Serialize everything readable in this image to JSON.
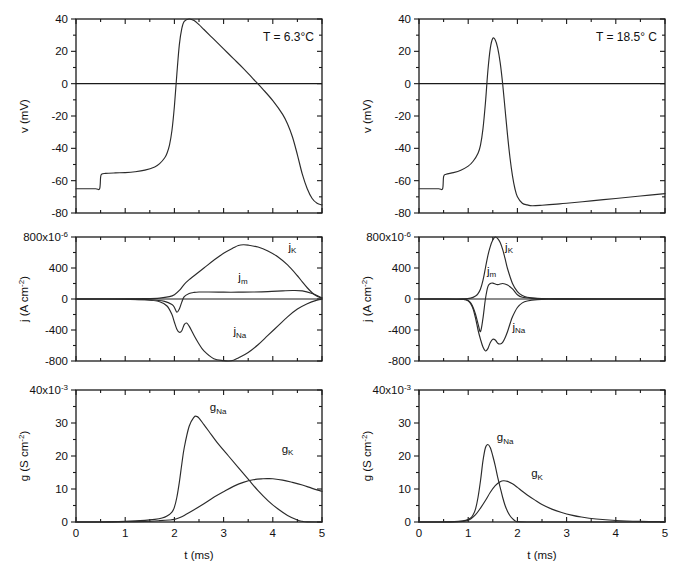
{
  "figure": {
    "title": "",
    "columns": [
      {
        "id": "left",
        "annotation": "T = 6.3°C"
      },
      {
        "id": "right",
        "annotation": "T = 18.5° C"
      }
    ],
    "xlabel": "t (ms)",
    "xlabel_2": "t (ms)"
  },
  "axes": {
    "x": {
      "label": "t (ms)",
      "min": 0,
      "max": 5,
      "ticks": [
        0,
        1,
        2,
        3,
        4,
        5
      ],
      "ticklabels": [
        "0",
        "1",
        "2",
        "3",
        "4",
        "5"
      ],
      "minor_ticks": [
        0.5,
        1.5,
        2.5,
        3.5,
        4.5
      ]
    },
    "v": {
      "label": "v (mV)",
      "min": -80,
      "max": 40,
      "ticks": [
        -80,
        -60,
        -40,
        -20,
        0,
        20,
        40
      ],
      "ticklabels": [
        "-80",
        "-60",
        "-40",
        "-20",
        "0",
        "20",
        "40"
      ],
      "minor_ticks": [
        -70,
        -50,
        -30,
        -10,
        10,
        30
      ]
    },
    "j": {
      "label": "j (A cm",
      "label_sup": "-2",
      "label_tail": ")",
      "min": -800,
      "max": 800,
      "ticks": [
        -800,
        -400,
        0,
        400,
        800
      ],
      "ticklabels": [
        "-800",
        "-400",
        "0",
        "400",
        "800x10"
      ],
      "exponent": "-6",
      "minor_ticks": [
        -600,
        -200,
        200,
        600
      ]
    },
    "g": {
      "label": "g (S cm",
      "label_sup": "-2",
      "label_tail": ")",
      "min": 0,
      "max": 40,
      "ticks": [
        0,
        10,
        20,
        30,
        40
      ],
      "ticklabels": [
        "0",
        "10",
        "20",
        "30",
        "40x10"
      ],
      "exponent": "-3",
      "minor_ticks": [
        5,
        15,
        25,
        35
      ]
    }
  },
  "chart_data": [
    {
      "id": "v-left",
      "type": "line",
      "title": "",
      "annotation": "T = 6.3°C",
      "xlabel": "",
      "ylabel": "v (mV)",
      "xlim": [
        0,
        5
      ],
      "ylim": [
        -80,
        40
      ],
      "grid": false,
      "legend": "none",
      "zero_line": 0,
      "series": [
        {
          "name": "v",
          "x": [
            0,
            0.2,
            0.4,
            0.48,
            0.5,
            0.52,
            0.6,
            0.8,
            1.0,
            1.2,
            1.4,
            1.6,
            1.7,
            1.8,
            1.85,
            1.9,
            1.95,
            2.0,
            2.05,
            2.1,
            2.15,
            2.2,
            2.3,
            2.4,
            2.5,
            2.6,
            2.8,
            3.0,
            3.2,
            3.4,
            3.6,
            3.8,
            4.0,
            4.2,
            4.3,
            4.4,
            4.5,
            4.6,
            4.7,
            4.8,
            4.9,
            5.0
          ],
          "y": [
            -65,
            -65,
            -65,
            -65,
            -58,
            -56,
            -55.5,
            -55.2,
            -55,
            -54.5,
            -53.5,
            -51.5,
            -49.5,
            -46,
            -43,
            -38,
            -29,
            -14,
            6,
            24,
            34,
            38.5,
            40,
            39,
            36.5,
            33.5,
            27.5,
            21.5,
            15.5,
            9.5,
            3,
            -3.5,
            -10.5,
            -19,
            -25,
            -33,
            -44,
            -56,
            -65,
            -71,
            -74,
            -75
          ]
        }
      ]
    },
    {
      "id": "v-right",
      "type": "line",
      "title": "",
      "annotation": "T = 18.5° C",
      "xlabel": "",
      "ylabel": "v (mV)",
      "xlim": [
        0,
        5
      ],
      "ylim": [
        -80,
        40
      ],
      "grid": false,
      "legend": "none",
      "zero_line": 0,
      "series": [
        {
          "name": "v",
          "x": [
            0,
            0.2,
            0.4,
            0.48,
            0.5,
            0.55,
            0.7,
            0.85,
            1.0,
            1.1,
            1.2,
            1.25,
            1.3,
            1.35,
            1.4,
            1.45,
            1.5,
            1.55,
            1.6,
            1.65,
            1.7,
            1.75,
            1.8,
            1.85,
            1.9,
            1.95,
            2.0,
            2.1,
            2.2,
            2.3,
            2.5,
            2.8,
            3.0,
            3.5,
            4.0,
            4.5,
            5.0
          ],
          "y": [
            -65,
            -65,
            -65,
            -65,
            -57.5,
            -56,
            -55,
            -53.5,
            -51,
            -48,
            -43,
            -38,
            -28,
            -12,
            8,
            22,
            28,
            27,
            22,
            13,
            0,
            -16,
            -32,
            -46,
            -57,
            -65,
            -70,
            -74,
            -75,
            -75.5,
            -75.2,
            -74.5,
            -74,
            -72.5,
            -71,
            -69.5,
            -68
          ]
        }
      ]
    },
    {
      "id": "j-left",
      "type": "line",
      "title": "",
      "xlabel": "",
      "ylabel": "j (A cm-2)",
      "xlim": [
        0,
        5
      ],
      "ylim": [
        -800,
        800
      ],
      "grid": false,
      "legend": "inline",
      "zero_line": 0,
      "series": [
        {
          "name": "jK",
          "label": "j_K",
          "label_pos": [
            4.32,
            620
          ],
          "x": [
            0,
            0.5,
            1.0,
            1.4,
            1.7,
            1.9,
            2.0,
            2.1,
            2.2,
            2.3,
            2.4,
            2.6,
            2.8,
            3.0,
            3.2,
            3.3,
            3.4,
            3.5,
            3.7,
            3.9,
            4.1,
            4.3,
            4.5,
            4.6,
            4.7,
            4.8,
            4.9,
            5.0
          ],
          "y": [
            0,
            0,
            2,
            5,
            12,
            30,
            55,
            110,
            190,
            250,
            300,
            400,
            500,
            590,
            660,
            690,
            700,
            695,
            670,
            620,
            545,
            440,
            300,
            220,
            145,
            80,
            35,
            10
          ]
        },
        {
          "name": "jm",
          "label": "j_m",
          "label_pos": [
            3.3,
            230
          ],
          "x": [
            0,
            0.5,
            1.0,
            1.5,
            1.8,
            1.95,
            2.0,
            2.05,
            2.1,
            2.15,
            2.2,
            2.3,
            2.4,
            2.5,
            2.7,
            3.0,
            3.3,
            3.6,
            3.9,
            4.2,
            4.4,
            4.6,
            4.8,
            5.0
          ],
          "y": [
            0,
            0,
            -2,
            -10,
            -30,
            -70,
            -110,
            -170,
            -130,
            -40,
            30,
            70,
            85,
            90,
            90,
            88,
            88,
            90,
            95,
            105,
            110,
            105,
            70,
            15
          ]
        },
        {
          "name": "jNa",
          "label": "j_Na",
          "label_pos": [
            3.2,
            -470
          ],
          "x": [
            0,
            0.5,
            1.0,
            1.4,
            1.7,
            1.85,
            1.95,
            2.0,
            2.05,
            2.1,
            2.15,
            2.2,
            2.25,
            2.3,
            2.4,
            2.5,
            2.6,
            2.8,
            3.0,
            3.1,
            3.2,
            3.3,
            3.5,
            3.7,
            3.9,
            4.1,
            4.3,
            4.5,
            4.7,
            4.9,
            5.0
          ],
          "y": [
            0,
            0,
            -3,
            -10,
            -35,
            -90,
            -200,
            -300,
            -390,
            -430,
            -410,
            -330,
            -310,
            -350,
            -470,
            -580,
            -670,
            -770,
            -795,
            -800,
            -790,
            -760,
            -690,
            -590,
            -470,
            -350,
            -230,
            -130,
            -60,
            -15,
            -5
          ]
        }
      ]
    },
    {
      "id": "j-right",
      "type": "line",
      "title": "",
      "xlabel": "",
      "ylabel": "j (A cm-2)",
      "xlim": [
        0,
        5
      ],
      "ylim": [
        -800,
        800
      ],
      "grid": false,
      "legend": "inline",
      "zero_line": 0,
      "series": [
        {
          "name": "jK",
          "label": "j_K",
          "label_pos": [
            1.75,
            620
          ],
          "x": [
            0,
            0.5,
            0.9,
            1.05,
            1.15,
            1.2,
            1.25,
            1.3,
            1.35,
            1.4,
            1.45,
            1.5,
            1.55,
            1.6,
            1.65,
            1.7,
            1.75,
            1.8,
            1.9,
            2.0,
            2.1,
            2.2,
            2.4,
            2.7,
            3.0,
            3.5,
            4.0,
            5.0
          ],
          "y": [
            0,
            0,
            3,
            12,
            40,
            70,
            130,
            240,
            400,
            560,
            680,
            760,
            800,
            780,
            730,
            640,
            520,
            390,
            200,
            95,
            45,
            22,
            8,
            3,
            1,
            0,
            0,
            0
          ]
        },
        {
          "name": "jm",
          "label": "j_m",
          "label_pos": [
            1.38,
            310
          ],
          "x": [
            0,
            0.5,
            0.9,
            1.0,
            1.05,
            1.1,
            1.15,
            1.2,
            1.25,
            1.3,
            1.35,
            1.4,
            1.45,
            1.5,
            1.6,
            1.7,
            1.8,
            1.9,
            2.0,
            2.1,
            2.3,
            2.6,
            3.0,
            4.0,
            5.0
          ],
          "y": [
            0,
            0,
            -5,
            -20,
            -50,
            -110,
            -200,
            -320,
            -420,
            -250,
            0,
            160,
            200,
            205,
            185,
            200,
            180,
            130,
            55,
            22,
            8,
            3,
            1,
            0,
            0
          ]
        },
        {
          "name": "jNa",
          "label": "j_Na",
          "label_pos": [
            1.9,
            -410
          ],
          "x": [
            0,
            0.5,
            0.9,
            1.0,
            1.05,
            1.1,
            1.15,
            1.2,
            1.25,
            1.3,
            1.35,
            1.4,
            1.45,
            1.5,
            1.55,
            1.6,
            1.65,
            1.7,
            1.75,
            1.8,
            1.85,
            1.9,
            2.0,
            2.1,
            2.2,
            2.4,
            2.7,
            3.0,
            4.0,
            5.0
          ],
          "y": [
            0,
            0,
            -5,
            -25,
            -60,
            -130,
            -250,
            -400,
            -520,
            -620,
            -670,
            -640,
            -560,
            -520,
            -530,
            -570,
            -580,
            -560,
            -500,
            -420,
            -320,
            -230,
            -110,
            -50,
            -25,
            -8,
            -3,
            -1,
            0,
            0
          ]
        }
      ]
    },
    {
      "id": "g-left",
      "type": "line",
      "title": "",
      "xlabel": "t (ms)",
      "ylabel": "g (S cm-2)",
      "xlim": [
        0,
        5
      ],
      "ylim": [
        0,
        40
      ],
      "grid": false,
      "legend": "inline",
      "zero_line": 0,
      "series": [
        {
          "name": "gNa",
          "label": "g_Na",
          "label_pos": [
            2.72,
            33.5
          ],
          "x": [
            0,
            0.5,
            1.0,
            1.4,
            1.6,
            1.75,
            1.85,
            1.95,
            2.0,
            2.05,
            2.1,
            2.15,
            2.2,
            2.3,
            2.4,
            2.45,
            2.5,
            2.6,
            2.7,
            2.9,
            3.1,
            3.3,
            3.5,
            3.7,
            3.9,
            4.1,
            4.3,
            4.5,
            4.6,
            4.7,
            5.0
          ],
          "y": [
            0,
            0,
            0.2,
            0.5,
            0.8,
            1.2,
            1.8,
            3.0,
            4.5,
            7.5,
            12,
            17.5,
            22.5,
            29,
            31.8,
            32,
            31.5,
            29.5,
            27.5,
            23.5,
            20,
            16.5,
            13,
            9.5,
            6.5,
            4.0,
            2.0,
            0.6,
            0.2,
            0.05,
            0
          ]
        },
        {
          "name": "gK",
          "label": "g_K",
          "label_pos": [
            4.18,
            21.0
          ],
          "x": [
            0,
            0.5,
            1.0,
            1.4,
            1.7,
            1.9,
            2.0,
            2.1,
            2.2,
            2.4,
            2.6,
            2.8,
            3.0,
            3.2,
            3.4,
            3.6,
            3.8,
            3.9,
            4.0,
            4.2,
            4.4,
            4.6,
            4.8,
            5.0
          ],
          "y": [
            0,
            0,
            0.1,
            0.2,
            0.4,
            0.6,
            0.8,
            1.3,
            2.0,
            3.7,
            5.5,
            7.5,
            9.2,
            10.8,
            12.0,
            12.8,
            13.1,
            13.15,
            13.1,
            12.7,
            12.0,
            11.2,
            10.2,
            9.3
          ]
        }
      ]
    },
    {
      "id": "g-right",
      "type": "line",
      "title": "",
      "xlabel": "t (ms)",
      "ylabel": "g (S cm-2)",
      "xlim": [
        0,
        5
      ],
      "ylim": [
        0,
        40
      ],
      "grid": false,
      "legend": "inline",
      "zero_line": 0,
      "series": [
        {
          "name": "gNa",
          "label": "g_Na",
          "label_pos": [
            1.58,
            24.5
          ],
          "x": [
            0,
            0.4,
            0.8,
            0.95,
            1.05,
            1.1,
            1.15,
            1.2,
            1.25,
            1.3,
            1.35,
            1.4,
            1.45,
            1.5,
            1.55,
            1.6,
            1.65,
            1.7,
            1.75,
            1.8,
            1.85,
            1.9,
            1.95,
            2.0,
            2.2,
            2.5,
            3.0,
            4.0,
            5.0
          ],
          "y": [
            0,
            0,
            0.2,
            0.5,
            1.2,
            2.2,
            4.0,
            7.5,
            12.5,
            18.5,
            22.5,
            23.5,
            22.5,
            20,
            17,
            13.5,
            10.5,
            7.5,
            5.0,
            3.2,
            1.9,
            1.0,
            0.4,
            0.1,
            0,
            0,
            0,
            0,
            0
          ]
        },
        {
          "name": "gK",
          "label": "g_K",
          "label_pos": [
            2.28,
            13.5
          ],
          "x": [
            0,
            0.4,
            0.8,
            0.95,
            1.05,
            1.15,
            1.25,
            1.35,
            1.45,
            1.55,
            1.65,
            1.72,
            1.8,
            1.9,
            2.0,
            2.1,
            2.2,
            2.35,
            2.5,
            2.7,
            2.9,
            3.1,
            3.3,
            3.6,
            4.0,
            4.5,
            5.0
          ],
          "y": [
            0,
            0,
            0.1,
            0.3,
            0.9,
            2.2,
            4.2,
            6.5,
            9.0,
            11.0,
            12.2,
            12.5,
            12.3,
            11.6,
            10.5,
            9.3,
            8.2,
            6.7,
            5.3,
            3.9,
            2.9,
            2.1,
            1.5,
            0.9,
            0.45,
            0.2,
            0.1
          ]
        }
      ]
    }
  ]
}
